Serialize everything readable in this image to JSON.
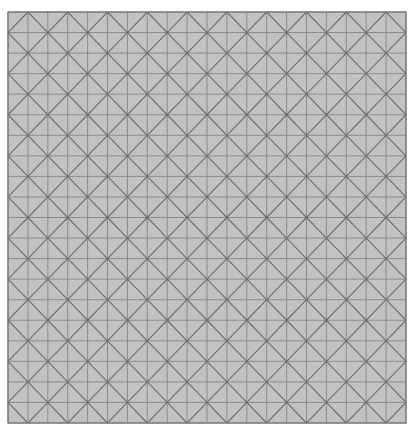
{
  "board": {
    "origin_x": 8,
    "origin_y": 12,
    "cols": 20,
    "rows": 20,
    "cell_w": 19.9,
    "cell_h": 20.55,
    "colors": {
      "background": "#ffffff",
      "light": "#c2c2c2",
      "dark": "#666666",
      "white": "#ffffff",
      "grid_line": "#8a8a8a",
      "diag_line": "#6e6e6e",
      "border": "#777777"
    },
    "highlight_centers": [
      [
        15,
        2
      ],
      [
        2,
        6
      ],
      [
        10,
        8
      ],
      [
        15,
        6
      ],
      [
        18,
        8
      ],
      [
        11,
        10
      ],
      [
        6,
        14
      ],
      [
        18,
        14
      ],
      [
        2,
        16
      ],
      [
        10,
        16
      ],
      [
        5,
        18
      ]
    ]
  }
}
